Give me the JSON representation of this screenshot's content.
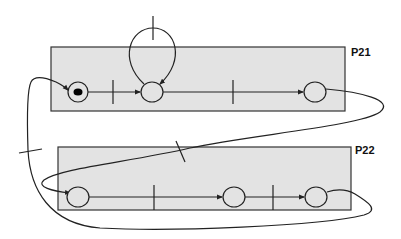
{
  "diagram": {
    "type": "petri-net",
    "colors": {
      "box_fill": "#e3e3e3",
      "stroke": "#222222",
      "token": "#000000"
    },
    "subnets": [
      {
        "id": "P21",
        "label": "P21",
        "places": [
          "p1",
          "p2",
          "p3"
        ],
        "transitions": [
          "t1",
          "t_loop",
          "t2"
        ]
      },
      {
        "id": "P22",
        "label": "P22",
        "places": [
          "p4",
          "p5",
          "p6"
        ],
        "transitions": [
          "t3",
          "t4"
        ]
      }
    ],
    "places": [
      {
        "id": "p1",
        "subnet": "P21",
        "tokens": 1
      },
      {
        "id": "p2",
        "subnet": "P21",
        "tokens": 0
      },
      {
        "id": "p3",
        "subnet": "P21",
        "tokens": 0
      },
      {
        "id": "p4",
        "subnet": "P22",
        "tokens": 0
      },
      {
        "id": "p5",
        "subnet": "P22",
        "tokens": 0
      },
      {
        "id": "p6",
        "subnet": "P22",
        "tokens": 0
      }
    ],
    "transitions": [
      {
        "id": "t1",
        "between": [
          "p1",
          "p2"
        ]
      },
      {
        "id": "t_loop",
        "self_loop_on": "p2"
      },
      {
        "id": "t2",
        "between": [
          "p2",
          "p3"
        ]
      },
      {
        "id": "t_cross_down",
        "between": [
          "p3",
          "p4"
        ]
      },
      {
        "id": "t3",
        "between": [
          "p4",
          "p5"
        ]
      },
      {
        "id": "t4",
        "between": [
          "p5",
          "p6"
        ]
      },
      {
        "id": "t_cross_up",
        "between": [
          "p6",
          "p1"
        ]
      }
    ]
  }
}
